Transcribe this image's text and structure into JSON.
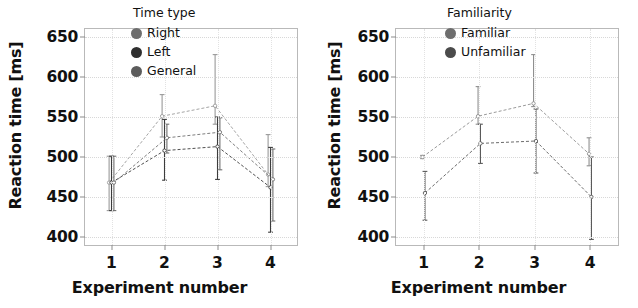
{
  "figure": {
    "panels": [
      {
        "id": "time-type",
        "xlabel": "Experiment number",
        "ylabel": "Reaction time [ms]",
        "legend_title": "Time type"
      },
      {
        "id": "familiarity",
        "xlabel": "Experiment number",
        "ylabel": "Reaction time [ms]",
        "legend_title": "Familiarity"
      }
    ]
  },
  "chart_data": [
    {
      "type": "line",
      "title": "",
      "xlabel": "Experiment number",
      "ylabel": "Reaction time [ms]",
      "legend_title": "Time type",
      "legend_position": "top-right",
      "grid": true,
      "x": [
        1,
        2,
        3,
        4
      ],
      "xticks": [
        "1",
        "2",
        "3",
        "4"
      ],
      "xlim": [
        0.5,
        4.5
      ],
      "ylim": [
        390,
        660
      ],
      "yticks": [
        400,
        450,
        500,
        550,
        600,
        650
      ],
      "error_type": "confidence interval",
      "series": [
        {
          "name": "Right",
          "color": "#9a9a9a",
          "values": [
            468,
            551,
            564,
            478
          ],
          "err_low": [
            433,
            525,
            541,
            463
          ],
          "err_high": [
            501,
            578,
            628,
            528
          ]
        },
        {
          "name": "Left",
          "color": "#3c3c3c",
          "values": [
            468,
            508,
            513,
            462
          ],
          "err_low": [
            433,
            471,
            472,
            406
          ],
          "err_high": [
            501,
            547,
            550,
            512
          ]
        },
        {
          "name": "General",
          "color": "#6f6f6f",
          "values": [
            468,
            524,
            531,
            472
          ],
          "err_low": [
            433,
            505,
            484,
            420
          ],
          "err_high": [
            501,
            541,
            549,
            510
          ]
        }
      ]
    },
    {
      "type": "line",
      "title": "",
      "xlabel": "Experiment number",
      "ylabel": "Reaction time [ms]",
      "legend_title": "Familiarity",
      "legend_position": "top-right",
      "grid": true,
      "x": [
        1,
        2,
        3,
        4
      ],
      "xticks": [
        "1",
        "2",
        "3",
        "4"
      ],
      "xlim": [
        0.5,
        4.5
      ],
      "ylim": [
        390,
        660
      ],
      "yticks": [
        400,
        450,
        500,
        550,
        600,
        650
      ],
      "error_type": "confidence interval",
      "series": [
        {
          "name": "Familiar",
          "color": "#8f8f8f",
          "values": [
            500,
            551,
            567,
            504
          ],
          "err_low": [
            498,
            541,
            563,
            489
          ],
          "err_high": [
            502,
            588,
            628,
            524
          ]
        },
        {
          "name": "Unfamiliar",
          "color": "#5a5a5a",
          "values": [
            455,
            517,
            520,
            450
          ],
          "err_low": [
            421,
            492,
            480,
            397
          ],
          "err_high": [
            482,
            541,
            560,
            500
          ]
        }
      ]
    }
  ]
}
